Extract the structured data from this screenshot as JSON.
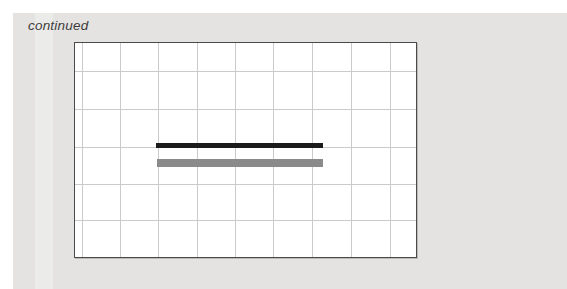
{
  "page": {
    "note_continued": "continued",
    "background_color": "#ffffff",
    "panel_color": "#e4e3e1",
    "note_color": "#3d3d3d"
  },
  "chart_data": {
    "type": "bar",
    "orientation": "horizontal",
    "title": "",
    "xlabel": "",
    "ylabel": "",
    "axis_tick_labels_visible": false,
    "legend_visible": false,
    "plot_area": {
      "left_px": 74,
      "top_px": 42,
      "width_px": 343,
      "height_px": 216,
      "border_color": "#4a4a4a",
      "background": "#ffffff"
    },
    "grid": {
      "visible": true,
      "color": "#cbcbcd",
      "cell_size_px": 38,
      "vertical_offsets_px": [
        7,
        45,
        83,
        122,
        160,
        198,
        237,
        276,
        315
      ],
      "horizontal_offsets_px": [
        28,
        66,
        104,
        141,
        177,
        214
      ]
    },
    "series": [
      {
        "name": "upper-black-bar",
        "color": "#1b1b1b",
        "left_px": 81,
        "top_px": 100,
        "width_px": 167,
        "height_px": 5
      },
      {
        "name": "lower-gray-bar",
        "color": "#8a8a8a",
        "left_px": 82,
        "top_px": 116,
        "width_px": 166,
        "height_px": 8
      }
    ]
  }
}
